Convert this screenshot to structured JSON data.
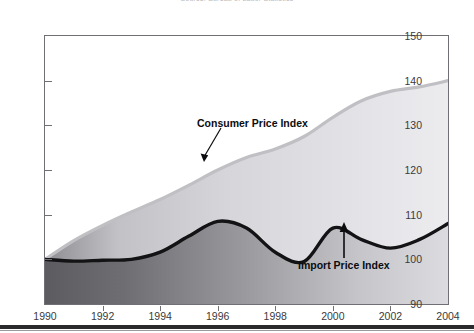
{
  "header": {
    "note": "Source: Bureau of Labor Statistics"
  },
  "chart_data": {
    "type": "area",
    "title": "",
    "subtitle": "",
    "xlabel": "",
    "ylabel": "",
    "xlim": [
      1990,
      2004
    ],
    "ylim": [
      90,
      150
    ],
    "grid": false,
    "legend_position": "inline-annotations",
    "x_ticks": [
      "1990",
      "1992",
      "1994",
      "1996",
      "1998",
      "2000",
      "2002",
      "2004"
    ],
    "y_ticks": [
      "90",
      "100",
      "110",
      "120",
      "130",
      "140",
      "150"
    ],
    "x": [
      1990,
      1991,
      1992,
      1993,
      1994,
      1995,
      1996,
      1997,
      1998,
      1999,
      2000,
      2001,
      2002,
      2003,
      2004
    ],
    "series": [
      {
        "name": "Consumer Price Index",
        "color": "#c9c9cc",
        "values": [
          100.0,
          104.2,
          107.6,
          110.6,
          113.4,
          116.6,
          120.0,
          122.8,
          124.7,
          127.5,
          131.8,
          135.5,
          137.6,
          138.6,
          140.0
        ]
      },
      {
        "name": "Import Price Index",
        "color": "#1a1a1c",
        "values": [
          100.0,
          99.6,
          99.8,
          100.0,
          101.6,
          105.2,
          108.5,
          107.0,
          101.6,
          99.5,
          107.0,
          104.4,
          102.5,
          104.4,
          108.0
        ]
      }
    ],
    "annotations": [
      {
        "text": "Consumer Price Index",
        "target_year": 1997,
        "target_value": 119.5
      },
      {
        "text": "Import Price Index",
        "target_year": 2000,
        "target_value": 106.8
      }
    ]
  }
}
